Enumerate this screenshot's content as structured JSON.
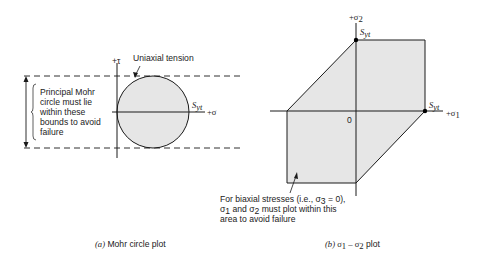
{
  "figure": {
    "panel_a": {
      "caption_prefix": "(a)",
      "caption_text": " Mohr circle plot",
      "tau_axis_label": "+τ",
      "sigma_axis_label": "+σ",
      "syt_label_main": "S",
      "syt_label_sub": "yt",
      "callout_uniaxial": "Uniaxial tension",
      "bounds_note_lines": [
        "Principal Mohr",
        "circle must lie",
        "within these",
        "bounds to avoid",
        "failure"
      ],
      "colors": {
        "fill": "#e6e6e6",
        "stroke": "#1a1a1a"
      }
    },
    "panel_b": {
      "caption_prefix": "(b)",
      "caption_sigma1": " σ",
      "caption_sub1": "1",
      "caption_dash": " – σ",
      "caption_sub2": "2",
      "caption_tail": " plot",
      "sigma2_axis_label": "+σ",
      "sigma2_axis_sub": "2",
      "sigma1_axis_label": "+σ",
      "sigma1_axis_sub": "1",
      "origin_label": "0",
      "syt_top_main": "S",
      "syt_top_sub": "yt",
      "syt_right_main": "S",
      "syt_right_sub": "yt",
      "note_line1": "For biaxial stresses (i.e., σ",
      "note_line1_sub": "3",
      "note_line1_tail": " = 0),",
      "note_line2_sym": "σ",
      "note_line2_sub1": "1",
      "note_line2_mid": " and σ",
      "note_line2_sub2": "2",
      "note_line2_tail": " must plot within this",
      "note_line3": "area to avoid failure",
      "colors": {
        "fill": "#e6e6e6",
        "stroke": "#1a1a1a"
      }
    }
  }
}
